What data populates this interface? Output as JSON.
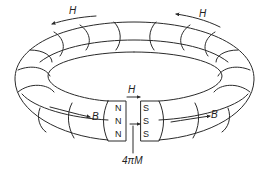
{
  "diagram": {
    "colors": {
      "stroke": "#2a2a2a",
      "background": "#ffffff",
      "text": "#222222"
    },
    "labels": {
      "h_top_left": "H",
      "h_top_right": "H",
      "h_gap": "H",
      "b_left": "B",
      "b_right": "B",
      "magnetization": "4πM"
    },
    "north_face": {
      "poles": [
        "N",
        "N",
        "N"
      ]
    },
    "south_face": {
      "poles": [
        "S",
        "S",
        "S"
      ]
    },
    "arrows": [
      {
        "id": "h-top-left",
        "direction": "counterclockwise",
        "label": "H"
      },
      {
        "id": "h-top-right",
        "direction": "counterclockwise",
        "label": "H"
      },
      {
        "id": "h-gap",
        "direction": "right",
        "label": "H"
      },
      {
        "id": "b-left",
        "direction": "right",
        "label": "B"
      },
      {
        "id": "b-right",
        "direction": "right",
        "label": "B"
      },
      {
        "id": "m-gap",
        "direction": "right",
        "label": "4πM"
      }
    ]
  }
}
